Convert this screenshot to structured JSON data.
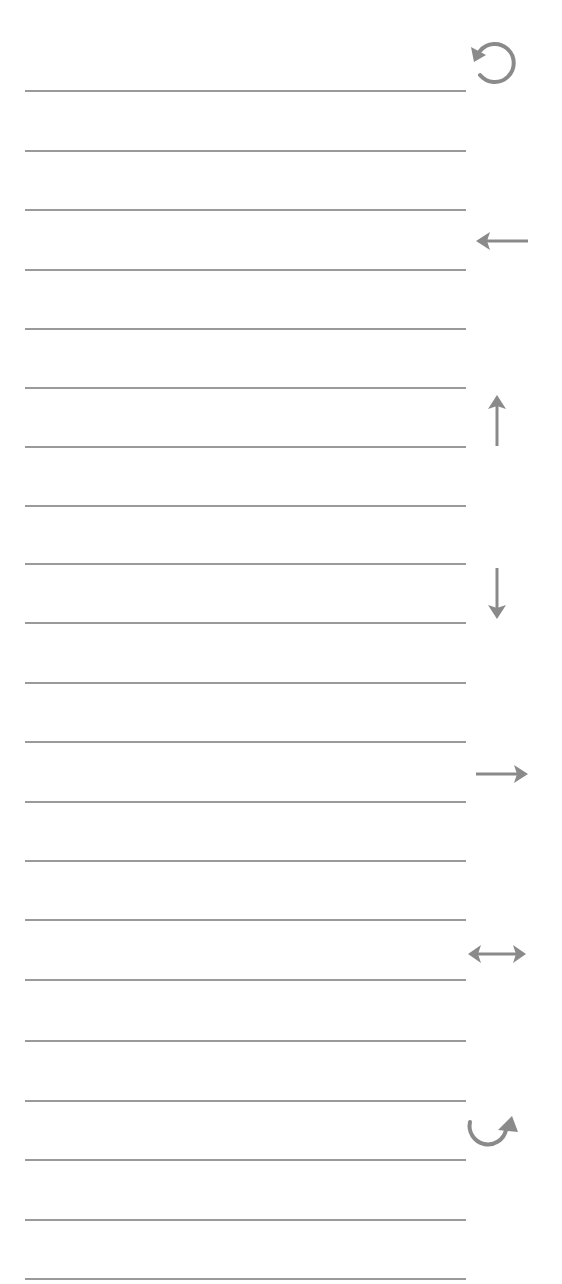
{
  "colors": {
    "line": "#9a9a9a",
    "icon": "#8a8a8a",
    "background": "#ffffff"
  },
  "lines": {
    "count": 21,
    "y_positions": [
      91,
      151,
      210,
      270,
      329,
      388,
      447,
      506,
      564,
      623,
      683,
      742,
      802,
      861,
      920,
      980,
      1041,
      1101,
      1160,
      1220,
      1279
    ]
  },
  "icons": [
    {
      "name": "rotate-counterclockwise-icon",
      "y": 60
    },
    {
      "name": "arrow-left-icon",
      "y": 240
    },
    {
      "name": "arrow-up-icon",
      "y": 420
    },
    {
      "name": "arrow-down-icon",
      "y": 595
    },
    {
      "name": "arrow-right-icon",
      "y": 773
    },
    {
      "name": "arrow-left-right-icon",
      "y": 953
    },
    {
      "name": "rotate-clockwise-icon",
      "y": 1132
    }
  ]
}
